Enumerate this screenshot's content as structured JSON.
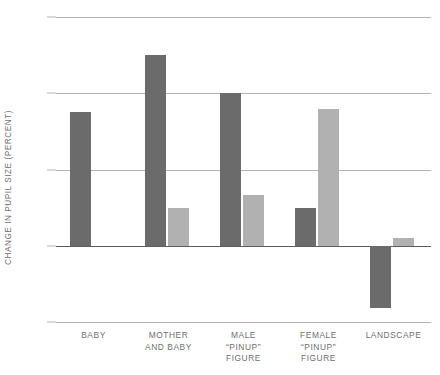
{
  "chart_data": {
    "type": "bar",
    "title": "",
    "subtitle": "",
    "xlabel": "",
    "ylabel": "CHANGE IN PUPIL SIZE (PERCENT)",
    "categories": [
      "BABY",
      "MOTHER AND BABY",
      "MALE \"PINUP\" FIGURE",
      "FEMALE \"PINUP\" FIGURE",
      "LANDSCAPE"
    ],
    "category_lines": [
      [
        "BABY"
      ],
      [
        "MOTHER",
        "AND BABY"
      ],
      [
        "MALE",
        "“PINUP”",
        "FIGURE"
      ],
      [
        "FEMALE",
        "“PINUP”",
        "FIGURE"
      ],
      [
        "LANDSCAPE"
      ]
    ],
    "series": [
      {
        "name": "series-dark",
        "color": "#6b6b6b",
        "values": [
          17.5,
          25.0,
          20.0,
          5.0,
          -8.1
        ]
      },
      {
        "name": "series-light",
        "color": "#b1b1b1",
        "values": [
          null,
          5.0,
          6.7,
          18.0,
          1.0
        ]
      }
    ],
    "ylim": [
      -10,
      30
    ],
    "yticks": [
      30,
      20,
      10,
      0,
      -10
    ],
    "ytick_labels": [
      "30",
      "20",
      "10",
      "0",
      "–10"
    ],
    "grid": true,
    "legend": "none",
    "zero_line": 0
  }
}
